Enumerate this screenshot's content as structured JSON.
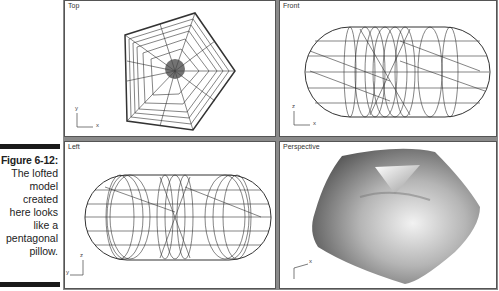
{
  "caption": {
    "figure_label": "Figure 6-12:",
    "lines": [
      "The lofted",
      "model",
      "created",
      "here looks",
      "like a",
      "pentagonal",
      "pillow."
    ]
  },
  "viewports": [
    {
      "label": "Top",
      "axes": {
        "vertical": "y",
        "horizontal": "x"
      }
    },
    {
      "label": "Front",
      "axes": {
        "vertical": "z",
        "horizontal": "x"
      }
    },
    {
      "label": "Left",
      "axes": {
        "vertical": "z",
        "horizontal": "y"
      }
    },
    {
      "label": "Perspective",
      "axes": {
        "horizontal": "x"
      }
    }
  ],
  "colors": {
    "caption_bar": "#1a1a1a",
    "viewport_bg": "#ffffff",
    "viewport_divider": "#8a8a8a",
    "wireframe": "#333333"
  }
}
